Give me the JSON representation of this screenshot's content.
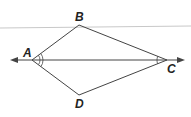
{
  "diagram": {
    "type": "kite-quadrilateral",
    "points": {
      "A": {
        "label": "A",
        "x": 32,
        "y": 60
      },
      "B": {
        "label": "B",
        "x": 79,
        "y": 25
      },
      "C": {
        "label": "C",
        "x": 167,
        "y": 60
      },
      "D": {
        "label": "D",
        "x": 79,
        "y": 95
      }
    },
    "segments": [
      "AB",
      "BC",
      "CD",
      "DA"
    ],
    "diagonal_line": {
      "through": "AC",
      "arrows": "both"
    },
    "angle_marks": [
      {
        "vertex": "A",
        "angles": [
          "BAC",
          "CAD"
        ],
        "arcs": 2
      },
      {
        "vertex": "C",
        "angles": [
          "BCA",
          "ACD"
        ],
        "arcs": 1
      }
    ],
    "colors": {
      "stroke": "#333333",
      "guide_line": "#bbbbbb"
    }
  }
}
